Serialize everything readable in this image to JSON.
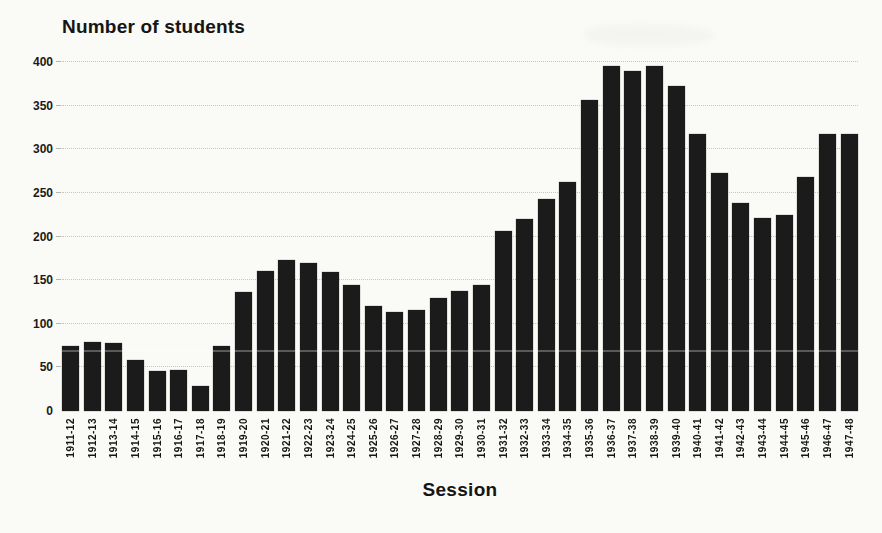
{
  "chart_data": {
    "type": "bar",
    "title": "Number of students",
    "xlabel": "Session",
    "ylabel": "Number of students",
    "categories": [
      "1911-12",
      "1912-13",
      "1913-14",
      "1914-15",
      "1915-16",
      "1916-17",
      "1917-18",
      "1918-19",
      "1919-20",
      "1920-21",
      "1921-22",
      "1922-23",
      "1923-24",
      "1924-25",
      "1925-26",
      "1926-27",
      "1927-28",
      "1928-29",
      "1929-30",
      "1930-31",
      "1931-32",
      "1932-33",
      "1933-34",
      "1934-35",
      "1935-36",
      "1936-37",
      "1937-38",
      "1938-39",
      "1939-40",
      "1940-41",
      "1941-42",
      "1942-43",
      "1943-44",
      "1944-45",
      "1945-46",
      "1946-47",
      "1947-48"
    ],
    "values": [
      74,
      79,
      78,
      58,
      46,
      47,
      29,
      75,
      136,
      161,
      173,
      170,
      159,
      145,
      120,
      114,
      116,
      129,
      138,
      144,
      206,
      220,
      243,
      262,
      357,
      395,
      390,
      395,
      372,
      317,
      273,
      238,
      221,
      225,
      268,
      318,
      318
    ],
    "ylim": [
      0,
      400
    ],
    "yticks": [
      0,
      50,
      100,
      150,
      200,
      250,
      300,
      350,
      400
    ],
    "grid": true,
    "gridline_style": "dotted",
    "legend": "none",
    "bar_color": "#1b1b1b",
    "background_color": "#fafaf7"
  }
}
